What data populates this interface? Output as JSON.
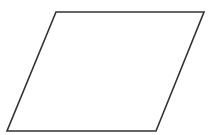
{
  "diagram": {
    "shape": "parallelogram",
    "points": [
      [
        56,
        12
      ],
      [
        204,
        12
      ],
      [
        156,
        131
      ],
      [
        7,
        131
      ]
    ],
    "stroke": "#333333",
    "stroke_width": 1.6,
    "fill": "#ffffff",
    "background": "#ffffff"
  }
}
